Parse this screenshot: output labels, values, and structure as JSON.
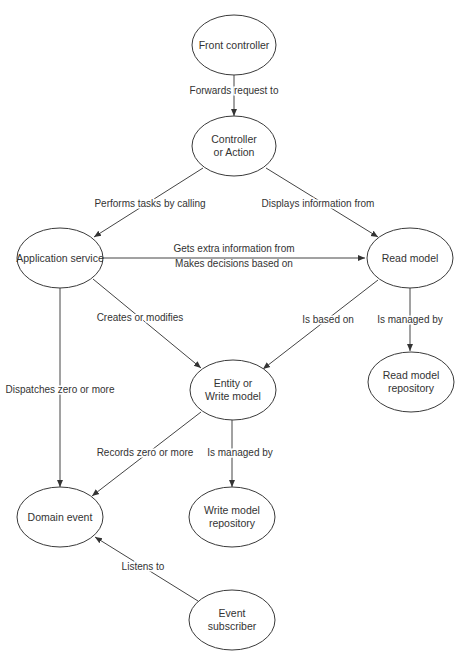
{
  "diagram": {
    "nodes": [
      {
        "id": "front_controller",
        "lines": [
          "Front controller"
        ]
      },
      {
        "id": "controller",
        "lines": [
          "Controller",
          "or Action"
        ]
      },
      {
        "id": "application_service",
        "lines": [
          "Application service"
        ]
      },
      {
        "id": "read_model",
        "lines": [
          "Read model"
        ]
      },
      {
        "id": "entity",
        "lines": [
          "Entity or",
          "Write model"
        ]
      },
      {
        "id": "read_model_repository",
        "lines": [
          "Read model",
          "repository"
        ]
      },
      {
        "id": "domain_event",
        "lines": [
          "Domain event"
        ]
      },
      {
        "id": "write_model_repository",
        "lines": [
          "Write model",
          "repository"
        ]
      },
      {
        "id": "event_subscriber",
        "lines": [
          "Event",
          "subscriber"
        ]
      }
    ],
    "edges": [
      {
        "from": "front_controller",
        "to": "controller",
        "label": "Forwards request to"
      },
      {
        "from": "controller",
        "to": "application_service",
        "label": "Performs tasks by calling"
      },
      {
        "from": "controller",
        "to": "read_model",
        "label": "Displays information from"
      },
      {
        "from": "application_service",
        "to": "read_model",
        "label": "Gets extra information from",
        "label2": "Makes decisions based on"
      },
      {
        "from": "application_service",
        "to": "entity",
        "label": "Creates or modifies"
      },
      {
        "from": "application_service",
        "to": "domain_event",
        "label": "Dispatches zero or more"
      },
      {
        "from": "read_model",
        "to": "entity",
        "label": "Is based on"
      },
      {
        "from": "read_model",
        "to": "read_model_repository",
        "label": "Is managed by"
      },
      {
        "from": "entity",
        "to": "domain_event",
        "label": "Records zero or more"
      },
      {
        "from": "entity",
        "to": "write_model_repository",
        "label": "Is managed by"
      },
      {
        "from": "event_subscriber",
        "to": "domain_event",
        "label": "Listens to"
      }
    ]
  }
}
